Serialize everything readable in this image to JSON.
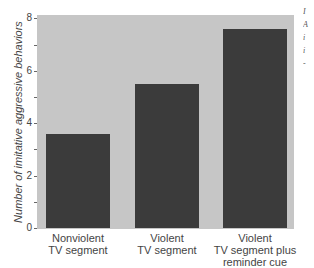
{
  "chart_data": {
    "type": "bar",
    "title": "",
    "xlabel": "",
    "ylabel": "Number of imitative aggressive behaviors",
    "categories": [
      "Nonviolent TV segment",
      "Violent TV segment",
      "Violent TV segment plus reminder cue"
    ],
    "category_lines": [
      [
        "Nonviolent",
        "TV segment",
        ""
      ],
      [
        "Violent",
        "TV segment",
        ""
      ],
      [
        "Violent",
        "TV segment plus",
        "reminder cue"
      ]
    ],
    "values": [
      3.6,
      5.5,
      7.6
    ],
    "ylim": [
      0,
      8
    ],
    "yticks": [
      0,
      1,
      2,
      3,
      4,
      5,
      6,
      7,
      8
    ],
    "ytick_labels": [
      "0",
      "",
      "2",
      "",
      "4",
      "",
      "6",
      "",
      "8"
    ],
    "grid": false,
    "legend": null,
    "colors": {
      "bar": "#3b3b3b",
      "plot_background": "#c6c6c6"
    }
  },
  "clipped_margin_text": [
    "I",
    "A",
    "i",
    "i",
    "-"
  ]
}
